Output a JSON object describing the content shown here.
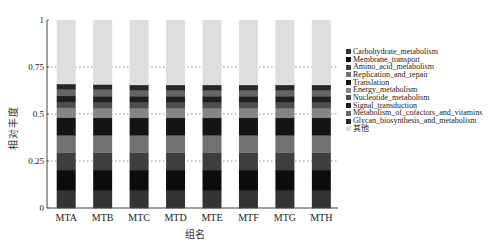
{
  "chart_data": {
    "type": "bar",
    "stacked": true,
    "title": "",
    "xlabel": "组名",
    "ylabel": "相对丰度",
    "ylim": [
      0,
      1
    ],
    "yticks": [
      0,
      0.25,
      0.5,
      0.75,
      1
    ],
    "ytick_labels": [
      "0",
      "0.25",
      "0.5",
      "0.75",
      "1"
    ],
    "grid": "horizontal dotted at 0.25, 0.5, 0.75",
    "legend_position": "right",
    "categories": [
      "MTA",
      "MTB",
      "MTC",
      "MTD",
      "MTE",
      "MTF",
      "MTG",
      "MTH"
    ],
    "series": [
      {
        "name": "Carbohydrate_metabolism",
        "color": "#333333",
        "values": [
          0.096,
          0.096,
          0.096,
          0.096,
          0.096,
          0.096,
          0.096,
          0.096
        ]
      },
      {
        "name": "Membrane_transport",
        "color": "#0c0c0c",
        "values": [
          0.106,
          0.106,
          0.106,
          0.106,
          0.106,
          0.106,
          0.106,
          0.106
        ]
      },
      {
        "name": "Amino_acid_metabolism",
        "color": "#3e3e3e",
        "values": [
          0.094,
          0.094,
          0.094,
          0.094,
          0.094,
          0.094,
          0.094,
          0.094
        ]
      },
      {
        "name": "Replication_and_repair",
        "color": "#727272",
        "values": [
          0.091,
          0.091,
          0.091,
          0.091,
          0.091,
          0.091,
          0.091,
          0.091
        ]
      },
      {
        "name": "Translation",
        "color": "#141414",
        "values": [
          0.095,
          0.093,
          0.093,
          0.093,
          0.093,
          0.093,
          0.093,
          0.093
        ]
      },
      {
        "name": "Energy_metabolism",
        "color": "#858585",
        "values": [
          0.052,
          0.052,
          0.052,
          0.052,
          0.052,
          0.052,
          0.052,
          0.052
        ]
      },
      {
        "name": "Nucleotide_metabolism",
        "color": "#4d4d4d",
        "values": [
          0.031,
          0.031,
          0.031,
          0.031,
          0.031,
          0.031,
          0.031,
          0.031
        ]
      },
      {
        "name": "Signal_transduction",
        "color": "#1e1e1e",
        "values": [
          0.032,
          0.032,
          0.032,
          0.032,
          0.032,
          0.032,
          0.032,
          0.032
        ]
      },
      {
        "name": "Metabolism_of_cofactors_and_vitamins",
        "color": "#656565",
        "values": [
          0.036,
          0.036,
          0.033,
          0.033,
          0.033,
          0.033,
          0.033,
          0.033
        ]
      },
      {
        "name": "Glycan_biosynthesis_and_metabolism",
        "color": "#262626",
        "values": [
          0.027,
          0.027,
          0.027,
          0.027,
          0.027,
          0.027,
          0.027,
          0.027
        ]
      },
      {
        "name": "其他",
        "color": "#dedede",
        "values": [
          0.34,
          0.342,
          0.345,
          0.345,
          0.345,
          0.345,
          0.345,
          0.345
        ]
      }
    ]
  },
  "axis": {
    "ylabel": "相对丰度",
    "xlabel": "组名"
  }
}
